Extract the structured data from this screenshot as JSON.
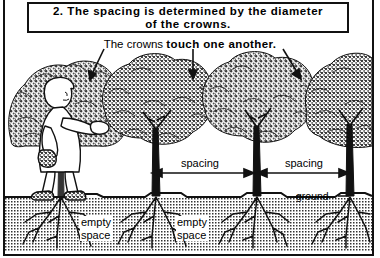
{
  "figure": {
    "title": {
      "number": "2.",
      "line1": "2.  The  spacing  is  determined  by  the  diameter",
      "line2": "of  the  crowns.",
      "full": "2. The spacing is determined by the diameter of the crowns."
    },
    "subtitle": {
      "plain": "The crowns ",
      "bold": "touch  one  another.",
      "full": "The crowns touch one another."
    },
    "labels": {
      "spacing_1": "spacing",
      "spacing_2": "spacing",
      "ground": "ground",
      "empty_space_1_line1": "empty",
      "empty_space_1_line2": "space",
      "empty_space_2_line1": "empty",
      "empty_space_2_line2": "space"
    },
    "colors": {
      "ink": "#111111",
      "paper": "#ffffff",
      "foliage": "#6b6b6b",
      "soil": "#7a7a7a"
    },
    "elements": {
      "tree_count": "4",
      "person": "woman-picking-fruit",
      "crown_arrows": "3",
      "spacing_arrows": "2"
    }
  }
}
